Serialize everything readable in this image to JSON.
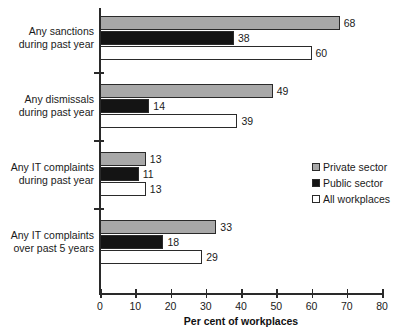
{
  "chart_data": {
    "type": "bar",
    "orientation": "horizontal",
    "title": "",
    "xlabel": "Per cent of workplaces",
    "ylabel": "",
    "xlim": [
      0,
      80
    ],
    "xticks": [
      0,
      10,
      20,
      30,
      40,
      50,
      60,
      70,
      80
    ],
    "grid": false,
    "legend_position": "right-middle",
    "categories": [
      "Any sanctions during past year",
      "Any dismissals during past year",
      "Any IT complaints during past year",
      "Any IT complaints over past 5 years"
    ],
    "category_lines": [
      [
        "Any sanctions",
        "during past year"
      ],
      [
        "Any dismissals",
        "during past year"
      ],
      [
        "Any IT complaints",
        "during past year"
      ],
      [
        "Any IT complaints",
        "over past 5 years"
      ]
    ],
    "series": [
      {
        "name": "Private sector",
        "color": "#a8a8a8",
        "values": [
          68,
          49,
          13,
          33
        ]
      },
      {
        "name": "Public sector",
        "color": "#141414",
        "values": [
          38,
          14,
          11,
          18
        ]
      },
      {
        "name": "All workplaces",
        "color": "#ffffff",
        "values": [
          60,
          39,
          13,
          29
        ]
      }
    ]
  },
  "legend": {
    "items": [
      {
        "label": "Private sector",
        "swatch": "private"
      },
      {
        "label": "Public sector",
        "swatch": "public"
      },
      {
        "label": "All workplaces",
        "swatch": "all"
      }
    ]
  },
  "axis": {
    "x_title": "Per cent of workplaces",
    "tick_labels": [
      "0",
      "10",
      "20",
      "30",
      "40",
      "50",
      "60",
      "70",
      "80"
    ]
  }
}
